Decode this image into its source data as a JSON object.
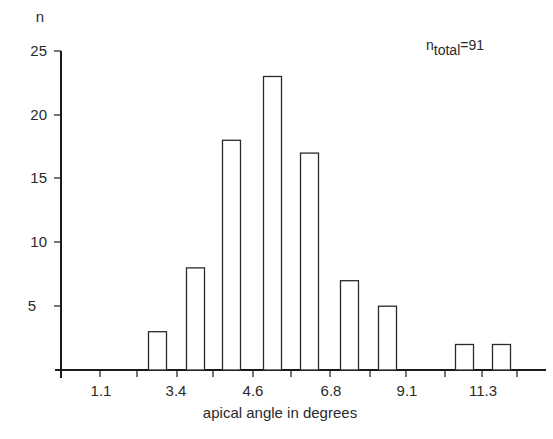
{
  "chart_data": {
    "type": "bar",
    "title": "",
    "xlabel": "apical angle in degrees",
    "ylabel": "n",
    "ylim": [
      0,
      25
    ],
    "yticks": [
      5,
      10,
      15,
      20,
      25
    ],
    "xtick_labels": [
      "1.1",
      "3.4",
      "4.6",
      "6.8",
      "9.1",
      "11.3"
    ],
    "grid": false,
    "legend": null,
    "annotation": {
      "base": "n",
      "subscript": "total",
      "suffix": "=91"
    },
    "bar_style": {
      "fill": "#ffffff",
      "stroke": "#2a2a2a"
    },
    "categories": [
      "bin1",
      "bin2",
      "bin3",
      "bin4",
      "bin5",
      "bin6",
      "bin7",
      "bin8",
      "bin9"
    ],
    "values": [
      3,
      8,
      18,
      23,
      17,
      7,
      5,
      2,
      2
    ]
  },
  "labels": {
    "y_axis_title": "n",
    "x_axis_title": "apical angle in degrees",
    "y_ticks": [
      "5",
      "10",
      "15",
      "20",
      "25"
    ],
    "x_ticks": [
      "1.1",
      "3.4",
      "4.6",
      "6.8",
      "9.1",
      "11.3"
    ],
    "annotation_base": "n",
    "annotation_sub": "total",
    "annotation_suffix": "=91"
  }
}
